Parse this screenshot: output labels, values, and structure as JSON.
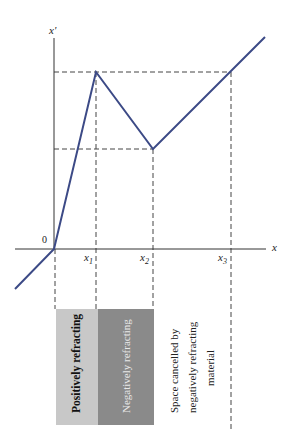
{
  "diagram": {
    "axes": {
      "y_label": "x'",
      "x_label": "x",
      "origin_label": "0",
      "tick_labels": [
        "x",
        "x",
        "x"
      ],
      "tick_subscripts": [
        "1",
        "2",
        "3"
      ]
    },
    "regions": [
      {
        "label": "Positively refracting",
        "fill": "#c8c8c8",
        "text_color": "#111111"
      },
      {
        "label": "Negatively refracting",
        "fill": "#8a8a8a",
        "text_color": "#e8e8e8"
      }
    ],
    "annotation": {
      "lines": [
        "Space cancelled by",
        "negatively refracting",
        "material"
      ]
    },
    "colors": {
      "curve": "#3c4a86",
      "axis": "#333333",
      "dashed": "#444444"
    }
  }
}
